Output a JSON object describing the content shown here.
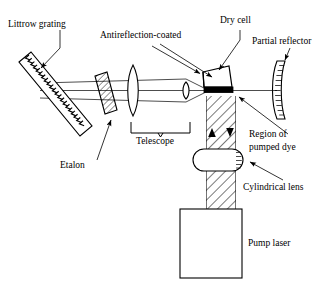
{
  "figure": {
    "background": "#ffffff",
    "ink": "#000000",
    "width": 330,
    "height": 291
  },
  "labels": {
    "littrow_grating": "Littrow grating",
    "antireflection_coated": "Antireflection-coated",
    "dry_cell": "Dry cell",
    "partial_reflector": "Partial reflector",
    "etalon": "Etalon",
    "telescope": "Telescope",
    "region_of_pumped_dye_line1": "Region of",
    "region_of_pumped_dye_line2": "pumped dye",
    "cylindrical_lens": "Cylindrical lens",
    "pump_laser": "Pump laser"
  },
  "components": [
    {
      "name": "littrow-grating",
      "kind": "blazed-diffraction-grating",
      "label": "Littrow grating",
      "orientation": "tilted",
      "teeth": 22
    },
    {
      "name": "etalon",
      "kind": "tilted-hatched-plate",
      "label": "Etalon"
    },
    {
      "name": "telescope-large-lens",
      "kind": "biconvex-lens",
      "label": "Telescope"
    },
    {
      "name": "telescope-small-lens",
      "kind": "biconvex-lens",
      "label": "Telescope"
    },
    {
      "name": "dry-cell",
      "kind": "prism-trapezoid",
      "label": "Dry cell",
      "coating": "Antireflection-coated"
    },
    {
      "name": "partial-reflector",
      "kind": "curved-output-coupler",
      "label": "Partial reflector"
    },
    {
      "name": "pumped-dye-region",
      "kind": "hatched-column",
      "label": "Region of pumped dye"
    },
    {
      "name": "cylindrical-lens",
      "kind": "capsule-lens",
      "label": "Cylindrical lens"
    },
    {
      "name": "pump-laser",
      "kind": "rectangular-box",
      "label": "Pump laser"
    }
  ]
}
